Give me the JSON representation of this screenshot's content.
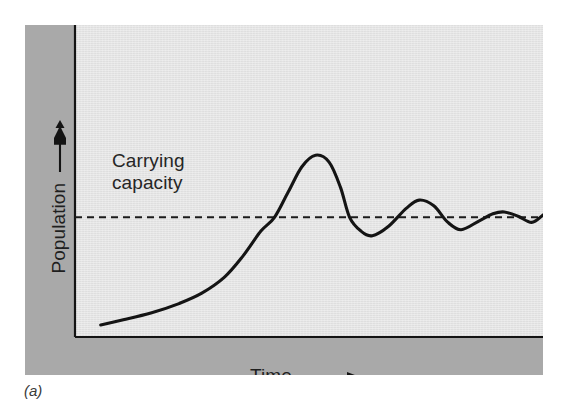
{
  "figure": {
    "caption": "(a)",
    "carrying_capacity_label": "Carrying\ncapacity",
    "y_axis_label": "Population",
    "x_axis_label": "Time",
    "y_axis_arrow_icon": "arrow-up-icon",
    "x_axis_arrow_icon": "arrow-right-icon",
    "colors": {
      "panel_band": "#a9a9a9",
      "plot_field": "#e4e4e4",
      "curve": "#141414",
      "axis": "#141414",
      "carrying_capacity_line": "#1a1a1a",
      "text": "#262626"
    }
  },
  "chart_data": {
    "type": "line",
    "title": "",
    "subtitle": "",
    "xlabel": "Time",
    "ylabel": "Population",
    "grid": false,
    "legend": null,
    "axis_ticks": {
      "x": [],
      "y": []
    },
    "axis_arrows": {
      "x": "right",
      "y": "up"
    },
    "xlim": [
      0,
      1
    ],
    "ylim": [
      0,
      1
    ],
    "annotations": [
      {
        "text": "Carrying capacity",
        "type": "reference-line-label",
        "x": 0.04,
        "y": 0.58
      }
    ],
    "reference_lines": [
      {
        "name": "Carrying capacity",
        "orientation": "horizontal",
        "y": 0.49,
        "style": "dashed",
        "color": "#1a1a1a"
      }
    ],
    "series": [
      {
        "name": "Population size",
        "style": "solid",
        "color": "#141414",
        "description": "Logistic growth with overshoot followed by damped oscillations converging on carrying capacity",
        "key_points": [
          {
            "label": "start",
            "x": 0.028,
            "y": 0.022
          },
          {
            "label": "exponential-phase",
            "x": 0.25,
            "y": 0.16
          },
          {
            "label": "inflection",
            "x": 0.36,
            "y": 0.44
          },
          {
            "label": "crosses-K-upward",
            "x": 0.41,
            "y": 0.49
          },
          {
            "label": "overshoot-peak-1",
            "x": 0.5,
            "y": 0.76
          },
          {
            "label": "crosses-K-downward",
            "x": 0.575,
            "y": 0.49
          },
          {
            "label": "trough-1",
            "x": 0.625,
            "y": 0.41
          },
          {
            "label": "peak-2",
            "x": 0.728,
            "y": 0.565
          },
          {
            "label": "trough-2",
            "x": 0.82,
            "y": 0.436
          },
          {
            "label": "peak-3",
            "x": 0.915,
            "y": 0.513
          },
          {
            "label": "trough-3",
            "x": 0.975,
            "y": 0.468
          },
          {
            "label": "converging-to-K",
            "x": 1.0,
            "y": 0.5
          }
        ],
        "x": [
          0.028,
          0.08,
          0.14,
          0.2,
          0.25,
          0.3,
          0.34,
          0.38,
          0.41,
          0.44,
          0.47,
          0.5,
          0.53,
          0.555,
          0.575,
          0.6,
          0.625,
          0.66,
          0.7,
          0.728,
          0.76,
          0.79,
          0.82,
          0.86,
          0.89,
          0.915,
          0.945,
          0.975,
          1.0
        ],
        "y": [
          0.022,
          0.045,
          0.075,
          0.115,
          0.16,
          0.23,
          0.32,
          0.43,
          0.49,
          0.6,
          0.71,
          0.76,
          0.73,
          0.62,
          0.49,
          0.43,
          0.41,
          0.45,
          0.53,
          0.565,
          0.54,
          0.47,
          0.436,
          0.475,
          0.505,
          0.513,
          0.495,
          0.468,
          0.5
        ]
      }
    ]
  }
}
